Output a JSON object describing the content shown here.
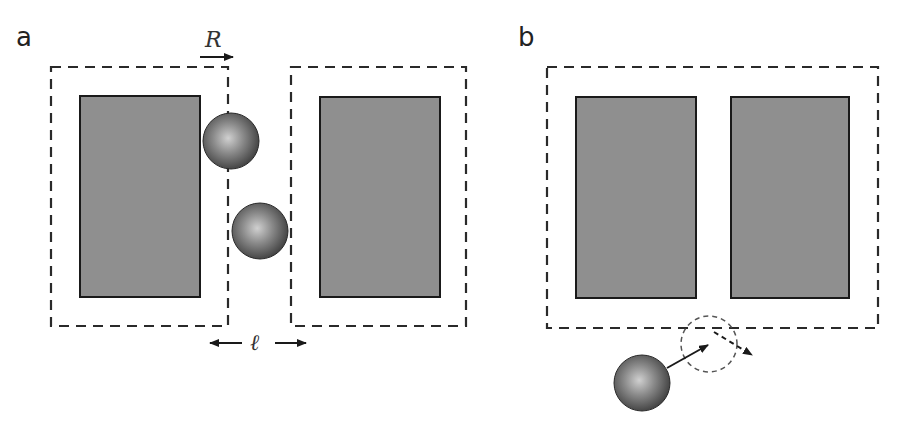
{
  "figure": {
    "panels": [
      {
        "label": "a",
        "annotations": {
          "range_symbol": "R",
          "gap_symbol": "ℓ"
        },
        "elements": [
          "two solid grey rectangles",
          "dashed boundaries offset by R",
          "two shaded spheres in gap"
        ]
      },
      {
        "label": "b",
        "elements": [
          "two solid grey rectangles",
          "single merged dashed boundary",
          "shaded sphere with arrow",
          "dashed circle",
          "dashed deflection arrow"
        ]
      }
    ],
    "colors": {
      "rect_fill": "#8f8f8f",
      "rect_stroke": "#1a1a1a",
      "dash": "#2a2a2a",
      "sphere_dark": "#3a3a3a",
      "sphere_light": "#c8c8c8"
    }
  }
}
